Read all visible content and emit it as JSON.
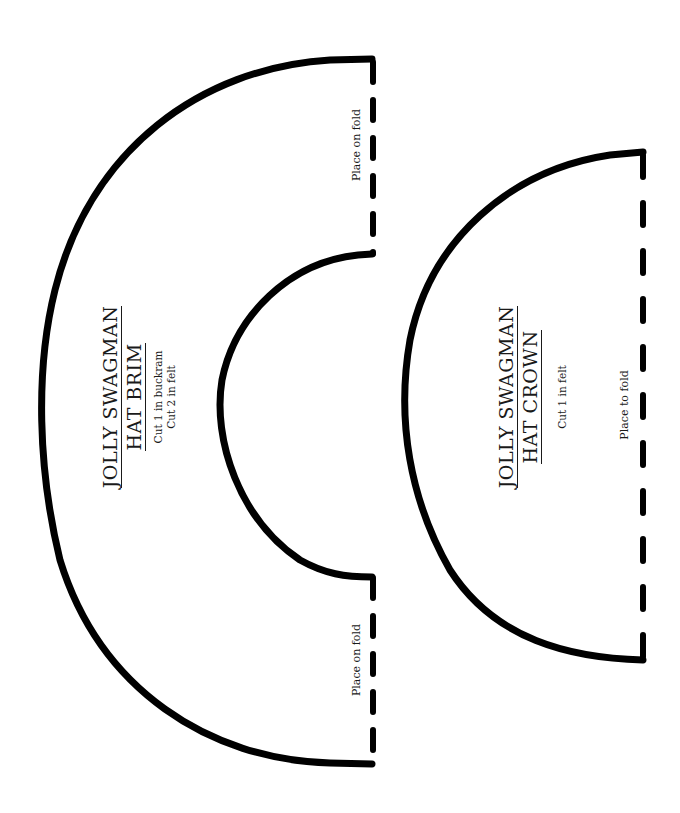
{
  "pattern": {
    "stroke_color": "#000000",
    "background": "#ffffff",
    "pieces": [
      {
        "id": "brim",
        "title_line1": "JOLLY SWAGMAN",
        "title_line2": "HAT BRIM",
        "instructions": [
          "Cut 1 in buckram",
          "Cut 2 in felt"
        ],
        "fold_labels": [
          "Place on fold",
          "Place on fold"
        ]
      },
      {
        "id": "crown",
        "title_line1": "JOLLY SWAGMAN",
        "title_line2": "HAT CROWN",
        "instructions": [
          "Cut 1 in felt"
        ],
        "fold_labels": [
          "Place to fold"
        ]
      }
    ]
  }
}
